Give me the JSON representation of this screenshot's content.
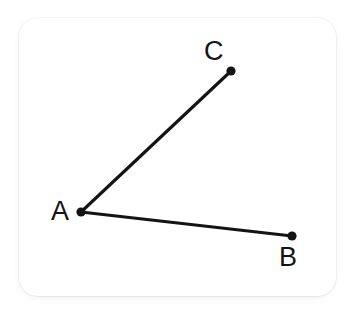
{
  "figure": {
    "type": "geometry-diagram",
    "background_color": "#ffffff",
    "card": {
      "fill_color": "#ffffff",
      "corner_radius": 19,
      "x": 19,
      "y": 18,
      "width": 317,
      "height": 278
    },
    "stroke_color": "#141414",
    "stroke_width": 3,
    "vertex_radius": 4.6,
    "points": [
      {
        "id": "A",
        "label": "A",
        "x": 81,
        "y": 212,
        "label_x": 51,
        "label_y": 198
      },
      {
        "id": "B",
        "label": "B",
        "x": 292,
        "y": 236,
        "label_x": 279,
        "label_y": 244
      },
      {
        "id": "C",
        "label": "C",
        "x": 231,
        "y": 71,
        "label_x": 204,
        "label_y": 38
      }
    ],
    "segments": [
      {
        "id": "AC",
        "from": "A",
        "to": "C",
        "x1": 81,
        "y1": 212,
        "x2": 231,
        "y2": 71
      },
      {
        "id": "AB",
        "from": "A",
        "to": "B",
        "x1": 81,
        "y1": 212,
        "x2": 292,
        "y2": 236
      }
    ],
    "labels": {
      "A": "A",
      "B": "B",
      "C": "C"
    }
  },
  "chart_data": {
    "type": "scatter",
    "title": "",
    "xlabel": "",
    "ylabel": "",
    "categories": [
      "A",
      "B",
      "C"
    ],
    "x": [
      81,
      292,
      231
    ],
    "y": [
      212,
      236,
      71
    ],
    "annotations": [
      "A",
      "B",
      "C"
    ],
    "series": [
      {
        "name": "vertices",
        "values": [
          212,
          236,
          71
        ]
      }
    ],
    "edges": [
      [
        "A",
        "C"
      ],
      [
        "A",
        "B"
      ]
    ],
    "grid": false,
    "legend": "none",
    "xlim": [
      19,
      336
    ],
    "ylim": [
      18,
      296
    ]
  }
}
